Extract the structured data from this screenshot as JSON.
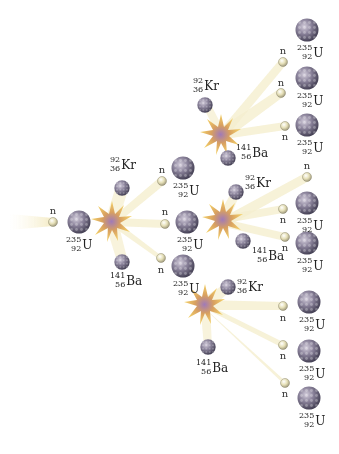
{
  "diagram": {
    "type": "nuclear-fission-chain-reaction",
    "colors": {
      "nucleus_dark": "#5a5570",
      "nucleus_light": "#b8b0c8",
      "neutron": "#e8e4c0",
      "flash_outer": "#f2c84a",
      "flash_inner": "#9c7bb0",
      "beam": "#f5ecc0"
    },
    "neutron_label": "n",
    "isotopes": {
      "uranium": {
        "mass": "235",
        "atomic": "92",
        "symbol": "U"
      },
      "krypton": {
        "mass": "92",
        "atomic": "36",
        "symbol": "Kr"
      },
      "barium": {
        "mass": "141",
        "atomic": "56",
        "symbol": "Ba"
      }
    },
    "generations": [
      {
        "stage": 1,
        "description": "Incoming neutron strikes U-235 nucleus"
      },
      {
        "stage": 2,
        "description": "U-235 splits into Kr-92 + Ba-141 + 3 neutrons"
      },
      {
        "stage": 3,
        "description": "3 neutrons strike 3 U-235 nuclei, each splitting into Kr-92 + Ba-141 + 3 neutrons"
      },
      {
        "stage": 4,
        "description": "9 neutrons approach 9 U-235 nuclei"
      }
    ]
  }
}
